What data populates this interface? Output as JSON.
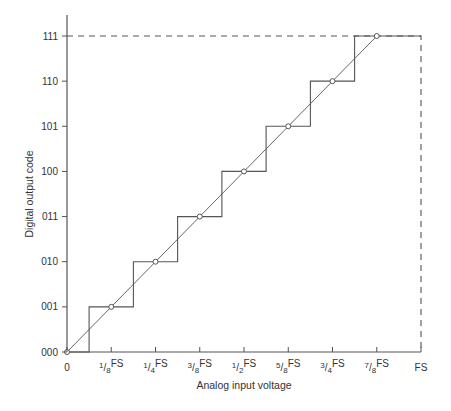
{
  "figure": {
    "xlabel": "Analog input voltage",
    "ylabel": "Digital output code"
  },
  "x_ticks": [
    {
      "num": "",
      "den": "",
      "text": "0"
    },
    {
      "num": "1",
      "den": "8",
      "text": "FS"
    },
    {
      "num": "1",
      "den": "4",
      "text": "FS"
    },
    {
      "num": "3",
      "den": "8",
      "text": "FS"
    },
    {
      "num": "1",
      "den": "2",
      "text": "FS"
    },
    {
      "num": "5",
      "den": "8",
      "text": "FS"
    },
    {
      "num": "3",
      "den": "4",
      "text": "FS"
    },
    {
      "num": "7",
      "den": "8",
      "text": "FS"
    },
    {
      "num": "",
      "den": "",
      "text": "FS"
    }
  ],
  "y_ticks": [
    "000",
    "001",
    "010",
    "011",
    "100",
    "101",
    "110",
    "111"
  ],
  "colors": {
    "axis": "#555555",
    "staircase": "#555555",
    "ideal_line": "#555555",
    "dashed": "#555555",
    "text": "#333333"
  },
  "chart_data": {
    "type": "line",
    "title": "",
    "xlabel": "Analog input voltage",
    "ylabel": "Digital output code",
    "x_tick_labels": [
      "0",
      "1/8FS",
      "1/4FS",
      "3/8FS",
      "1/2FS",
      "5/8FS",
      "3/4FS",
      "7/8FS",
      "FS"
    ],
    "y_tick_labels": [
      "000",
      "001",
      "010",
      "011",
      "100",
      "101",
      "110",
      "111"
    ],
    "xlim": [
      0,
      1
    ],
    "ylim": [
      0,
      7
    ],
    "series": [
      {
        "name": "Quantized staircase output",
        "style": "solid",
        "x": [
          0,
          0.0625,
          0.0625,
          0.1875,
          0.1875,
          0.3125,
          0.3125,
          0.4375,
          0.4375,
          0.5625,
          0.5625,
          0.6875,
          0.6875,
          0.8125,
          0.8125,
          1.0
        ],
        "y": [
          0,
          0,
          1,
          1,
          2,
          2,
          3,
          3,
          4,
          4,
          5,
          5,
          6,
          6,
          7,
          7
        ]
      },
      {
        "name": "Ideal linear transfer",
        "style": "solid",
        "x": [
          0,
          0.875
        ],
        "y": [
          0,
          7
        ]
      },
      {
        "name": "Code centre points",
        "style": "markers-circle",
        "x": [
          0,
          0.125,
          0.25,
          0.375,
          0.5,
          0.625,
          0.75,
          0.875
        ],
        "y": [
          0,
          1,
          2,
          3,
          4,
          5,
          6,
          7
        ]
      },
      {
        "name": "Full-scale reference",
        "style": "dashed",
        "x": [
          0,
          1,
          1
        ],
        "y": [
          7,
          7,
          0
        ]
      }
    ],
    "grid": false,
    "legend": "none"
  }
}
